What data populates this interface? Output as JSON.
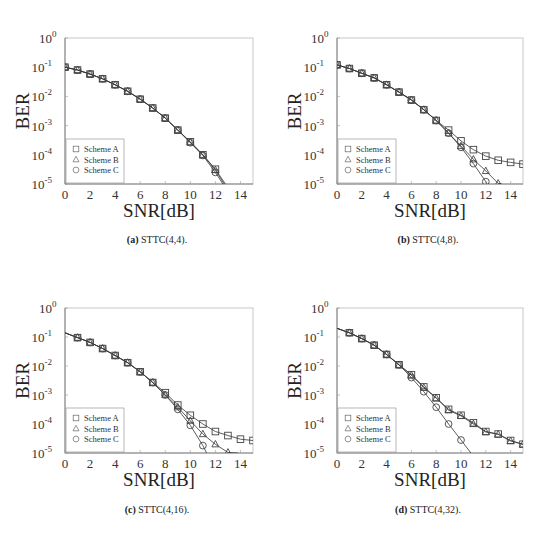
{
  "chart_data": [
    {
      "type": "line",
      "id": "a",
      "caption_label": "(a)",
      "caption_text": " STTC(4,4).",
      "xlabel": "SNR[dB]",
      "ylabel": "BER",
      "xlim": [
        0,
        15
      ],
      "ylim": [
        1e-05,
        1
      ],
      "yscale": "log",
      "xticks": [
        0,
        2,
        4,
        6,
        8,
        10,
        12,
        14
      ],
      "yticks": [
        1,
        0.1,
        0.01,
        0.001,
        0.0001,
        1e-05
      ],
      "ytick_labels": [
        [
          "10",
          "0"
        ],
        [
          "10",
          "-1"
        ],
        [
          "10",
          "-2"
        ],
        [
          "10",
          "-3"
        ],
        [
          "10",
          "-4"
        ],
        [
          "10",
          "-5"
        ]
      ],
      "legend": {
        "placement": "bottom-left",
        "entries": [
          "Scheme A",
          "Scheme B",
          "Scheme C"
        ]
      },
      "series": [
        {
          "name": "Scheme A",
          "marker": "square",
          "x": [
            0,
            1,
            2,
            3,
            4,
            5,
            6,
            7,
            8,
            9,
            10,
            11,
            12,
            12.8
          ],
          "y": [
            0.1,
            0.08,
            0.058,
            0.04,
            0.025,
            0.015,
            0.008,
            0.004,
            0.0018,
            0.0007,
            0.00028,
            0.0001,
            3.2e-05,
            1e-05
          ],
          "marker_count": 13
        },
        {
          "name": "Scheme B",
          "marker": "triangle",
          "x": [
            0,
            1,
            2,
            3,
            4,
            5,
            6,
            7,
            8,
            9,
            10,
            11,
            12,
            12.7
          ],
          "y": [
            0.1,
            0.08,
            0.058,
            0.04,
            0.025,
            0.015,
            0.008,
            0.004,
            0.0018,
            0.0007,
            0.00027,
            0.0001,
            3e-05,
            1e-05
          ],
          "marker_count": 13
        },
        {
          "name": "Scheme C",
          "marker": "circle",
          "x": [
            0,
            1,
            2,
            3,
            4,
            5,
            6,
            7,
            8,
            9,
            10,
            11,
            12,
            12.6
          ],
          "y": [
            0.1,
            0.08,
            0.058,
            0.04,
            0.025,
            0.015,
            0.008,
            0.004,
            0.0018,
            0.0007,
            0.00026,
            9.5e-05,
            2.5e-05,
            1e-05
          ],
          "marker_count": 13
        }
      ]
    },
    {
      "type": "line",
      "id": "b",
      "caption_label": "(b)",
      "caption_text": " STTC(4,8).",
      "xlabel": "SNR[dB]",
      "ylabel": "BER",
      "xlim": [
        0,
        15
      ],
      "ylim": [
        1e-05,
        1
      ],
      "yscale": "log",
      "xticks": [
        0,
        2,
        4,
        6,
        8,
        10,
        12,
        14
      ],
      "yticks": [
        1,
        0.1,
        0.01,
        0.001,
        0.0001,
        1e-05
      ],
      "ytick_labels": [
        [
          "10",
          "0"
        ],
        [
          "10",
          "-1"
        ],
        [
          "10",
          "-2"
        ],
        [
          "10",
          "-3"
        ],
        [
          "10",
          "-4"
        ],
        [
          "10",
          "-5"
        ]
      ],
      "legend": {
        "placement": "bottom-left",
        "entries": [
          "Scheme A",
          "Scheme B",
          "Scheme C"
        ]
      },
      "series": [
        {
          "name": "Scheme A",
          "marker": "square",
          "x": [
            0,
            1,
            2,
            3,
            4,
            5,
            6,
            7,
            8,
            9,
            10,
            11,
            12,
            13,
            14,
            15
          ],
          "y": [
            0.12,
            0.09,
            0.062,
            0.043,
            0.025,
            0.014,
            0.0075,
            0.0035,
            0.0015,
            0.0007,
            0.0003,
            0.00015,
            9e-05,
            6.5e-05,
            5.5e-05,
            4.8e-05
          ],
          "marker_count": 16
        },
        {
          "name": "Scheme B",
          "marker": "triangle",
          "x": [
            0,
            1,
            2,
            3,
            4,
            5,
            6,
            7,
            8,
            9,
            10,
            11,
            12,
            13,
            13.3
          ],
          "y": [
            0.12,
            0.09,
            0.062,
            0.043,
            0.025,
            0.014,
            0.0075,
            0.0035,
            0.0015,
            0.00055,
            0.0002,
            7e-05,
            2.8e-05,
            1.05e-05,
            1e-05
          ],
          "marker_count": 14
        },
        {
          "name": "Scheme C",
          "marker": "circle",
          "x": [
            0,
            1,
            2,
            3,
            4,
            5,
            6,
            7,
            8,
            9,
            10,
            11,
            12,
            12.1
          ],
          "y": [
            0.12,
            0.09,
            0.062,
            0.043,
            0.025,
            0.014,
            0.0075,
            0.0035,
            0.0015,
            0.00055,
            0.00018,
            5e-05,
            1.2e-05,
            1e-05
          ],
          "marker_count": 13
        }
      ]
    },
    {
      "type": "line",
      "id": "c",
      "caption_label": "(c)",
      "caption_text": " STTC(4,16).",
      "xlabel": "SNR[dB]",
      "ylabel": "BER",
      "xlim": [
        0,
        15
      ],
      "ylim": [
        1e-05,
        1
      ],
      "yscale": "log",
      "xticks": [
        0,
        2,
        4,
        6,
        8,
        10,
        12,
        14
      ],
      "yticks": [
        1,
        0.1,
        0.01,
        0.001,
        0.0001,
        1e-05
      ],
      "ytick_labels": [
        [
          "10",
          "0"
        ],
        [
          "10",
          "-1"
        ],
        [
          "10",
          "-2"
        ],
        [
          "10",
          "-3"
        ],
        [
          "10",
          "-4"
        ],
        [
          "10",
          "-5"
        ]
      ],
      "legend": {
        "placement": "bottom-left",
        "entries": [
          "Scheme A",
          "Scheme B",
          "Scheme C"
        ]
      },
      "series": [
        {
          "name": "Scheme A",
          "marker": "square",
          "marker_start": 1,
          "x": [
            0,
            1,
            2,
            3,
            4,
            5,
            6,
            7,
            8,
            9,
            10,
            11,
            12,
            13,
            14,
            15
          ],
          "y": [
            0.14,
            0.095,
            0.065,
            0.04,
            0.023,
            0.013,
            0.0063,
            0.0027,
            0.0012,
            0.00045,
            0.0002,
            0.0001,
            5.5e-05,
            4e-05,
            3e-05,
            2.7e-05
          ],
          "marker_count": 16
        },
        {
          "name": "Scheme B",
          "marker": "triangle",
          "marker_start": 1,
          "x": [
            0,
            1,
            2,
            3,
            4,
            5,
            6,
            7,
            8,
            9,
            10,
            11,
            12,
            13,
            13.8
          ],
          "y": [
            0.14,
            0.095,
            0.065,
            0.04,
            0.023,
            0.013,
            0.0063,
            0.0027,
            0.001,
            0.00038,
            0.00013,
            4.5e-05,
            2e-05,
            1.05e-05,
            1e-05
          ],
          "marker_count": 14
        },
        {
          "name": "Scheme C",
          "marker": "circle",
          "marker_start": 1,
          "x": [
            0,
            1,
            2,
            3,
            4,
            5,
            6,
            7,
            8,
            9,
            10,
            11,
            11.3
          ],
          "y": [
            0.14,
            0.095,
            0.065,
            0.04,
            0.023,
            0.013,
            0.0063,
            0.0027,
            0.001,
            0.00032,
            9e-05,
            1.8e-05,
            1e-05
          ],
          "marker_count": 12
        }
      ]
    },
    {
      "type": "line",
      "id": "d",
      "caption_label": "(d)",
      "caption_text": " STTC(4,32).",
      "xlabel": "SNR[dB]",
      "ylabel": "BER",
      "xlim": [
        0,
        15
      ],
      "ylim": [
        1e-05,
        1
      ],
      "yscale": "log",
      "xticks": [
        0,
        2,
        4,
        6,
        8,
        10,
        12,
        14
      ],
      "yticks": [
        1,
        0.1,
        0.01,
        0.001,
        0.0001,
        1e-05
      ],
      "ytick_labels": [
        [
          "10",
          "0"
        ],
        [
          "10",
          "-1"
        ],
        [
          "10",
          "-2"
        ],
        [
          "10",
          "-3"
        ],
        [
          "10",
          "-4"
        ],
        [
          "10",
          "-5"
        ]
      ],
      "legend": {
        "placement": "bottom-left",
        "entries": [
          "Scheme A",
          "Scheme B",
          "Scheme C"
        ]
      },
      "series": [
        {
          "name": "Scheme A",
          "marker": "square",
          "marker_start": 1,
          "x": [
            0,
            1,
            2,
            3,
            4,
            5,
            6,
            7,
            8,
            9,
            10,
            11,
            12,
            13,
            14,
            15
          ],
          "y": [
            0.2,
            0.14,
            0.088,
            0.052,
            0.025,
            0.011,
            0.005,
            0.0019,
            0.0008,
            0.00032,
            0.0002,
            0.00011,
            5.5e-05,
            4.5e-05,
            2.7e-05,
            2e-05
          ],
          "marker_count": 16
        },
        {
          "name": "Scheme B",
          "marker": "triangle",
          "marker_start": 1,
          "x": [
            0,
            1,
            2,
            3,
            4,
            5,
            6,
            7,
            8,
            9,
            10,
            11,
            12,
            13,
            14,
            15
          ],
          "y": [
            0.2,
            0.14,
            0.088,
            0.052,
            0.025,
            0.011,
            0.0048,
            0.0018,
            0.00078,
            0.0003,
            0.00019,
            0.0001,
            5.3e-05,
            4.4e-05,
            2.6e-05,
            2e-05
          ],
          "marker_count": 16
        },
        {
          "name": "Scheme C",
          "marker": "circle",
          "marker_start": 1,
          "x": [
            0,
            1,
            2,
            3,
            4,
            5,
            6,
            7,
            8,
            9,
            10,
            10.8
          ],
          "y": [
            0.2,
            0.14,
            0.088,
            0.052,
            0.025,
            0.011,
            0.004,
            0.0013,
            0.00038,
            0.0001,
            2.8e-05,
            1e-05
          ],
          "marker_count": 11
        }
      ]
    }
  ]
}
